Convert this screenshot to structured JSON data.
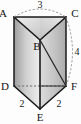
{
  "figure": {
    "type": "triangular-prism",
    "vertices": {
      "A": "A",
      "B": "B",
      "C": "C",
      "D": "D",
      "E": "E",
      "F": "F"
    },
    "measurements": {
      "top_edge_AC": "3",
      "right_edge_CF": "4",
      "bottom_left_edge_DE": "2",
      "bottom_right_edge_EF": "2"
    },
    "colors": {
      "outline": "#1a1a1a",
      "hidden_line": "#6e6e6e",
      "face_light": "#f2f2f2",
      "face_mid": "#d2d2d2",
      "face_dark": "#9a9a9a",
      "background": "#fdfdfd",
      "label_text": "#141414"
    },
    "geometry": {
      "A": [
        14,
        17
      ],
      "B": [
        40,
        40
      ],
      "C": [
        66,
        17
      ],
      "D": [
        14,
        86
      ],
      "E": [
        40,
        109
      ],
      "F": [
        66,
        86
      ],
      "arc_top": "dashed arc above A-C",
      "arc_right": "dashed arc right of C-F",
      "hidden_edge": "D-F dashed",
      "interior_diagonal": "B-F"
    }
  }
}
